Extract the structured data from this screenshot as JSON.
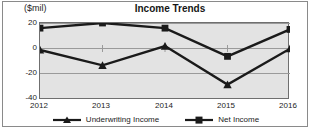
{
  "chart_data": {
    "type": "line",
    "title": "Income Trends",
    "xlabel": "",
    "ylabel": "($mil)",
    "unit_label": "($mil)",
    "categories": [
      "2012",
      "2013",
      "2014",
      "2015",
      "2016"
    ],
    "yticks": [
      "20",
      "0",
      "-20",
      "-40"
    ],
    "ylim": [
      -40,
      20
    ],
    "grid": true,
    "legend_position": "bottom",
    "series": [
      {
        "name": "Underwriting Income",
        "marker": "triangle",
        "color": "#1a1a1a",
        "values": [
          -1,
          -13,
          2,
          -28,
          0
        ]
      },
      {
        "name": "Net Income",
        "marker": "square",
        "color": "#1a1a1a",
        "values": [
          16,
          20,
          16,
          -6,
          15
        ]
      }
    ]
  },
  "colors": {
    "plot_background": "#e3e3e3",
    "frame": "#8a8a8a",
    "axis": "#6f6f6f",
    "series_line": "#1a1a1a",
    "gridline": "#9a9a9a"
  }
}
